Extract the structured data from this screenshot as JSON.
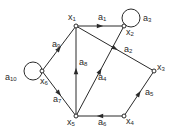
{
  "diagram": {
    "type": "directed-graph",
    "colors": {
      "stroke": "#2a2a2a",
      "background": "#ffffff"
    },
    "nodes": [
      {
        "id": "x1",
        "label": "x1",
        "x": 76,
        "y": 26,
        "lx": 68,
        "ly": 13
      },
      {
        "id": "x2",
        "label": "x2",
        "x": 124,
        "y": 26,
        "lx": 126,
        "ly": 28
      },
      {
        "id": "x3",
        "label": "x3",
        "x": 154,
        "y": 71,
        "lx": 157,
        "ly": 63
      },
      {
        "id": "x4",
        "label": "x4",
        "x": 124,
        "y": 116,
        "lx": 126,
        "ly": 117
      },
      {
        "id": "x5",
        "label": "x5",
        "x": 76,
        "y": 116,
        "lx": 67,
        "ly": 118
      },
      {
        "id": "x6",
        "label": "x6",
        "x": 42,
        "y": 71,
        "lx": 40,
        "ly": 77
      }
    ],
    "edges": [
      {
        "id": "a1",
        "label": "a1",
        "from": "x1",
        "to": "x2",
        "lx": 98,
        "ly": 13
      },
      {
        "id": "a2",
        "label": "a2",
        "from": "x1",
        "to": "x3",
        "lx": 124,
        "ly": 45
      },
      {
        "id": "a3",
        "label": "a3",
        "from": "x2",
        "to": "x2",
        "loop": true,
        "lx": 143,
        "ly": 14
      },
      {
        "id": "a4",
        "label": "a4",
        "from": "x5",
        "to": "x2",
        "lx": 98,
        "ly": 73
      },
      {
        "id": "a5",
        "label": "a5",
        "from": "x4",
        "to": "x3",
        "lx": 145,
        "ly": 88
      },
      {
        "id": "a6",
        "label": "a6",
        "from": "x4",
        "to": "x5",
        "lx": 98,
        "ly": 118
      },
      {
        "id": "a7",
        "label": "a7",
        "from": "x6",
        "to": "x5",
        "lx": 53,
        "ly": 95
      },
      {
        "id": "a8",
        "label": "a8",
        "from": "x5",
        "to": "x1",
        "lx": 79,
        "ly": 58
      },
      {
        "id": "a9",
        "label": "a9",
        "from": "x6",
        "to": "x1",
        "lx": 52,
        "ly": 40
      },
      {
        "id": "a10",
        "label": "a10",
        "from": "x6",
        "to": "x6",
        "loop": true,
        "lx": 5,
        "ly": 73
      }
    ]
  }
}
